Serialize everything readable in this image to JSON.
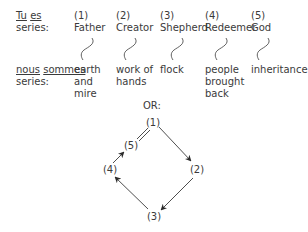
{
  "top_series": {
    "label_word1": "Tu",
    "label_word2": "es",
    "label_line2": "series:",
    "items": [
      {
        "number": "(1)",
        "name": "Father"
      },
      {
        "number": "(2)",
        "name": "Creator"
      },
      {
        "number": "(3)",
        "name": "Shepherd"
      },
      {
        "number": "(4)",
        "name": "Redeemer"
      },
      {
        "number": "(5)",
        "name": "God"
      }
    ]
  },
  "bottom_series": {
    "label_word1": "nous",
    "label_word2": "sommes",
    "label_line2": "series:",
    "items": [
      {
        "lines": [
          "earth",
          "and",
          "mire"
        ]
      },
      {
        "lines": [
          "work of",
          "hands"
        ]
      },
      {
        "lines": [
          "flock"
        ]
      },
      {
        "lines": [
          "people",
          "brought",
          "back"
        ]
      },
      {
        "lines": [
          "inheritance"
        ]
      }
    ]
  },
  "separator": "OR:",
  "cycle": {
    "nodes": [
      {
        "id": "1",
        "label": "(1)"
      },
      {
        "id": "2",
        "label": "(2)"
      },
      {
        "id": "3",
        "label": "(3)"
      },
      {
        "id": "4",
        "label": "(4)"
      },
      {
        "id": "5",
        "label": "(5)"
      }
    ],
    "edges": [
      {
        "from": "1",
        "to": "2",
        "type": "arrow"
      },
      {
        "from": "2",
        "to": "3",
        "type": "arrow"
      },
      {
        "from": "3",
        "to": "4",
        "type": "arrow"
      },
      {
        "from": "4",
        "to": "5",
        "type": "arrow"
      },
      {
        "from": "5",
        "to": "1",
        "type": "equals"
      }
    ]
  },
  "colors": {
    "text": "#3a3a3a",
    "line": "#3a3a3a"
  }
}
